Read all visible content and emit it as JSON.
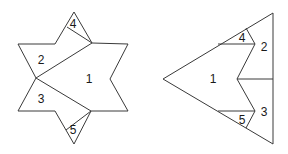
{
  "figures": [
    {
      "name": "hexagram-dissection",
      "outline": "74,12 92,43 128,44 110,79 128,111 91,111 74,144 55,111 18,111 36,78 18,44 55,44",
      "cuts": [
        "92,43 36,78",
        "36,78 91,111",
        "67,27 92,43",
        "66,130 91,111"
      ],
      "labels": [
        {
          "text": "1",
          "x": 89,
          "y": 79
        },
        {
          "text": "2",
          "x": 41,
          "y": 60
        },
        {
          "text": "3",
          "x": 41,
          "y": 99
        },
        {
          "text": "4",
          "x": 73,
          "y": 24
        },
        {
          "text": "5",
          "x": 73,
          "y": 130
        }
      ]
    },
    {
      "name": "triangle-rearrangement",
      "outline": "163,79 273,13 273,144",
      "cuts": [
        "218,44 255,44",
        "246,28 255,44",
        "255,44 237,79 255,111",
        "237,79 273,79",
        "218,111 255,111",
        "255,111 246,128"
      ],
      "labels": [
        {
          "text": "1",
          "x": 213,
          "y": 79
        },
        {
          "text": "2",
          "x": 264,
          "y": 47
        },
        {
          "text": "3",
          "x": 264,
          "y": 112
        },
        {
          "text": "4",
          "x": 242,
          "y": 38
        },
        {
          "text": "5",
          "x": 242,
          "y": 120
        }
      ]
    }
  ]
}
